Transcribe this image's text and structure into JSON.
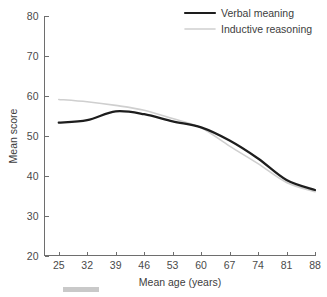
{
  "chart_data": {
    "type": "line",
    "title": "",
    "xlabel": "Mean age (years)",
    "ylabel": "Mean score",
    "xlim": [
      21.5,
      88
    ],
    "ylim": [
      20,
      80
    ],
    "xticks": [
      25,
      32,
      39,
      46,
      53,
      60,
      67,
      74,
      81,
      88
    ],
    "yticks": [
      20,
      30,
      40,
      50,
      60,
      70,
      80
    ],
    "grid": false,
    "legend_position": "top-right",
    "x": [
      25,
      32,
      39,
      46,
      53,
      60,
      67,
      74,
      81,
      88
    ],
    "series": [
      {
        "name": "Verbal meaning",
        "color": "#1d1d1d",
        "width": 2.2,
        "values": [
          53.3,
          53.9,
          56.1,
          55.4,
          53.6,
          52.1,
          48.8,
          44.3,
          38.9,
          36.4
        ]
      },
      {
        "name": "Inductive reasoning",
        "color": "#cfcfcf",
        "width": 1.6,
        "values": [
          59.1,
          58.5,
          57.6,
          56.4,
          54.3,
          52.0,
          47.4,
          43.0,
          38.3,
          36.0
        ]
      }
    ]
  },
  "legend": {
    "entries": [
      {
        "label": "Verbal meaning"
      },
      {
        "label": "Inductive reasoning"
      }
    ]
  },
  "axes": {
    "y_title": "Mean score",
    "x_title": "Mean age (years)",
    "y_tick_labels": [
      "80",
      "70",
      "60",
      "50",
      "40",
      "30",
      "20"
    ],
    "x_tick_labels": [
      "25",
      "32",
      "39",
      "46",
      "53",
      "60",
      "67",
      "74",
      "81",
      "88"
    ]
  },
  "colors": {
    "verbal_meaning": "#1d1d1d",
    "inductive_reasoning": "#cfcfcf",
    "axis": "#6e6e6e",
    "text": "#3d3d3d",
    "caption_bar": "#c9c9c9",
    "background": "#ffffff"
  }
}
